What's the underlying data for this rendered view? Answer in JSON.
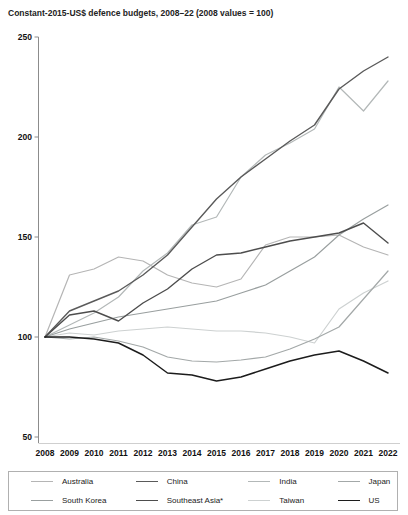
{
  "title": "Constant-2015-US$ defence budgets, 2008–22 (2008 values = 100)",
  "chart_data": {
    "type": "line",
    "title": "Constant-2015-US$ defence budgets, 2008–22 (2008 values = 100)",
    "x": [
      2008,
      2009,
      2010,
      2011,
      2012,
      2013,
      2014,
      2015,
      2016,
      2017,
      2018,
      2019,
      2020,
      2021,
      2022
    ],
    "ylim": [
      50,
      250
    ],
    "yticks": [
      50,
      100,
      150,
      200,
      250
    ],
    "grid": false,
    "legend_position": "bottom",
    "series": [
      {
        "name": "Australia",
        "color": "#b5b5b5",
        "width": 1.2,
        "values": [
          100,
          131,
          134,
          140,
          138,
          131,
          127,
          125,
          129,
          146,
          150,
          150,
          151,
          145,
          141
        ]
      },
      {
        "name": "China",
        "color": "#5a5a5a",
        "width": 1.4,
        "values": [
          100,
          113,
          118,
          123,
          131,
          141,
          155,
          169,
          180,
          189,
          198,
          206,
          224,
          233,
          240
        ]
      },
      {
        "name": "India",
        "color": "#b3b8b8",
        "width": 1.2,
        "values": [
          100,
          106,
          112,
          120,
          133,
          142,
          156,
          160,
          180,
          191,
          197,
          204,
          225,
          213,
          228
        ]
      },
      {
        "name": "Japan",
        "color": "#a3a8a8",
        "width": 1.2,
        "values": [
          100,
          99,
          100,
          98,
          95,
          90,
          88,
          87.5,
          88.5,
          90,
          94,
          99,
          105,
          119,
          133
        ]
      },
      {
        "name": "South Korea",
        "color": "#999f9f",
        "width": 1.2,
        "values": [
          100,
          104,
          107,
          110,
          112,
          114,
          116,
          118,
          122,
          126,
          133,
          140,
          151,
          159,
          166
        ]
      },
      {
        "name": "Southeast Asia*",
        "color": "#4d4d4d",
        "width": 1.4,
        "values": [
          100,
          111,
          113,
          108,
          117,
          124,
          134,
          141,
          142,
          145,
          148,
          150,
          152,
          157,
          147
        ]
      },
      {
        "name": "Taiwan",
        "color": "#cdd1d1",
        "width": 1.2,
        "values": [
          100,
          102,
          101,
          103,
          104,
          105,
          104,
          103,
          103,
          102,
          100,
          97,
          114,
          122,
          128
        ]
      },
      {
        "name": "US",
        "color": "#1c1c1c",
        "width": 1.5,
        "values": [
          100,
          100,
          99,
          97,
          91,
          82,
          81,
          78,
          80,
          84,
          88,
          91,
          93,
          88,
          82
        ]
      }
    ],
    "legend_order": [
      "Australia",
      "China",
      "India",
      "Japan",
      "South Korea",
      "Southeast Asia*",
      "Taiwan",
      "US"
    ]
  },
  "axes": {
    "y_labels": [
      "250",
      "200",
      "150",
      "100",
      "50"
    ],
    "x_labels": [
      "2008",
      "2009",
      "2010",
      "2011",
      "2012",
      "2013",
      "2014",
      "2015",
      "2016",
      "2017",
      "2018",
      "2019",
      "2020",
      "2021",
      "2022"
    ]
  }
}
